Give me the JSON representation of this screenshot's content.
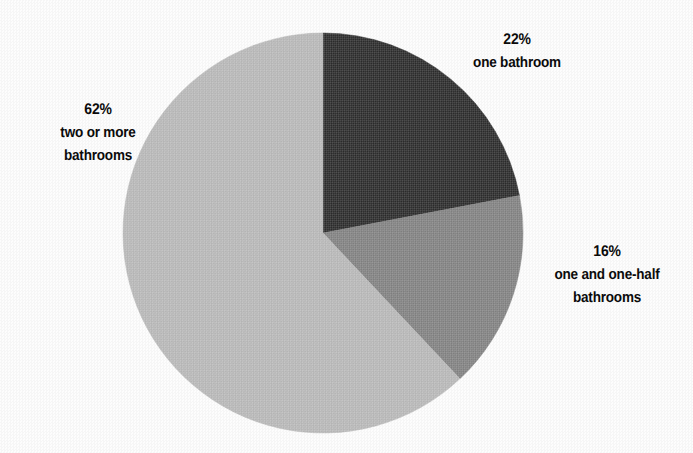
{
  "page": {
    "background_color": "#fdfdfd",
    "width": 693,
    "height": 453
  },
  "chart_data": {
    "type": "pie",
    "title": "",
    "subtitle": "",
    "xlabel": "",
    "ylabel": "",
    "grid": false,
    "legend_position": "none",
    "start_angle_deg": 0,
    "direction": "clockwise",
    "center": {
      "x": 323,
      "y": 233
    },
    "radius": 200,
    "unit": "%",
    "categories": [
      "one bathroom",
      "one and one-half bathrooms",
      "two or more bathrooms"
    ],
    "values": [
      22,
      16,
      62
    ],
    "slices": [
      {
        "label": "one bathroom",
        "value": 22,
        "value_text": "22%",
        "color": "#2b2b2b",
        "sweep_deg": 79.2,
        "start_deg": 0,
        "end_deg": 79.2
      },
      {
        "label": "one and one-half bathrooms",
        "value": 16,
        "value_text": "16%",
        "color": "#828282",
        "sweep_deg": 57.6,
        "start_deg": 79.2,
        "end_deg": 136.8
      },
      {
        "label": "two or more bathrooms",
        "value": 62,
        "value_text": "62%",
        "color": "#b9b9b9",
        "sweep_deg": 223.2,
        "start_deg": 136.8,
        "end_deg": 360
      }
    ],
    "annotations": [
      {
        "name": "one-bathroom",
        "percent_text": "22%",
        "caption_lines": [
          "one bathroom"
        ],
        "position": "top-right"
      },
      {
        "name": "one-and-one-half-bathrooms",
        "percent_text": "16%",
        "caption_lines": [
          "one and one-half",
          "bathrooms"
        ],
        "position": "right"
      },
      {
        "name": "two-or-more-bathrooms",
        "percent_text": "62%",
        "caption_lines": [
          "two or more",
          "bathrooms"
        ],
        "position": "left"
      }
    ]
  },
  "labels": {
    "one_bathroom": {
      "percent": "22%",
      "line1": "one bathroom"
    },
    "one_and_one_half": {
      "percent": "16%",
      "line1": "one and one-half",
      "line2": "bathrooms"
    },
    "two_or_more": {
      "percent": "62%",
      "line1": "two or more",
      "line2": "bathrooms"
    }
  },
  "colors": {
    "slice_dark": "#2b2b2b",
    "slice_medium": "#828282",
    "slice_light": "#b9b9b9",
    "text": "#0b0b0b",
    "background": "#fdfdfd"
  }
}
